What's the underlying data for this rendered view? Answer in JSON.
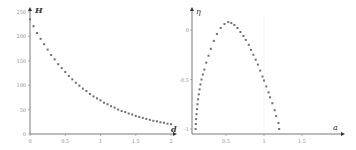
{
  "chart_data": [
    {
      "type": "scatter",
      "title": "",
      "xlabel": "d",
      "ylabel": "H",
      "xlim": [
        0,
        2.05
      ],
      "ylim": [
        0,
        250
      ],
      "grid": false,
      "x_ticks": [
        "0",
        "0.5",
        "1",
        "1.5",
        "2"
      ],
      "y_ticks": [
        "0",
        "50",
        "100",
        "150",
        "200",
        "250"
      ],
      "series": [
        {
          "name": "H(d)",
          "marker": "dot",
          "color": "#666666",
          "x": [
            0.0,
            0.05,
            0.1,
            0.15,
            0.2,
            0.25,
            0.3,
            0.35,
            0.4,
            0.45,
            0.5,
            0.55,
            0.6,
            0.65,
            0.7,
            0.75,
            0.8,
            0.85,
            0.9,
            0.95,
            1.0,
            1.05,
            1.1,
            1.15,
            1.2,
            1.25,
            1.3,
            1.35,
            1.4,
            1.45,
            1.5,
            1.55,
            1.6,
            1.65,
            1.7,
            1.75,
            1.8,
            1.85,
            1.9,
            1.95,
            2.0
          ],
          "y": [
            235,
            221,
            207,
            195,
            184,
            173,
            162,
            153,
            143,
            135,
            127,
            119,
            112,
            105,
            99,
            93,
            88,
            82,
            77,
            73,
            69,
            64,
            61,
            57,
            54,
            50,
            47,
            45,
            42,
            40,
            37,
            35,
            33,
            31,
            29,
            27,
            26,
            24,
            23,
            21,
            20
          ]
        }
      ]
    },
    {
      "type": "scatter",
      "title": "",
      "xlabel": "a",
      "ylabel": "η",
      "xlim": [
        0,
        1.95
      ],
      "ylim": [
        -1.05,
        0.2
      ],
      "grid": false,
      "x_ticks": [
        "0.5",
        "1",
        "1.5"
      ],
      "y_ticks": [
        "-1",
        "-0.5",
        "0"
      ],
      "series": [
        {
          "name": "η(a)",
          "marker": "dot",
          "color": "#666666",
          "x": [
            0.1,
            0.103,
            0.107,
            0.112,
            0.118,
            0.125,
            0.133,
            0.142,
            0.152,
            0.164,
            0.178,
            0.195,
            0.215,
            0.24,
            0.27,
            0.3,
            0.34,
            0.38,
            0.43,
            0.48,
            0.53,
            0.57,
            0.61,
            0.65,
            0.69,
            0.73,
            0.76,
            0.8,
            0.83,
            0.86,
            0.89,
            0.92,
            0.95,
            0.98,
            1.0,
            1.03,
            1.06,
            1.08,
            1.11,
            1.14,
            1.16,
            1.19,
            1.2
          ],
          "y": [
            -1.0,
            -0.95,
            -0.9,
            -0.85,
            -0.8,
            -0.75,
            -0.7,
            -0.65,
            -0.6,
            -0.55,
            -0.5,
            -0.45,
            -0.4,
            -0.33,
            -0.26,
            -0.19,
            -0.11,
            -0.04,
            0.02,
            0.06,
            0.08,
            0.07,
            0.05,
            0.02,
            -0.02,
            -0.06,
            -0.1,
            -0.15,
            -0.2,
            -0.25,
            -0.3,
            -0.35,
            -0.41,
            -0.47,
            -0.51,
            -0.57,
            -0.63,
            -0.68,
            -0.74,
            -0.81,
            -0.87,
            -0.94,
            -1.0
          ]
        }
      ]
    }
  ],
  "left_chart": {
    "ylabel": "H",
    "xlabel": "d",
    "y_ticks": [
      "250",
      "200",
      "150",
      "100",
      "50",
      "0"
    ],
    "x_ticks": [
      "0",
      "0.5",
      "1",
      "1.5",
      "2"
    ]
  },
  "right_chart": {
    "ylabel": "η",
    "xlabel": "a",
    "y_ticks": [
      "0",
      "-0.5",
      "-1"
    ],
    "x_ticks": [
      "0.5",
      "1",
      "1.5"
    ]
  },
  "style": {
    "axis_color": "#555555",
    "point_color": "#6e6e6e",
    "tick_label_color": "#8a8a8a"
  }
}
